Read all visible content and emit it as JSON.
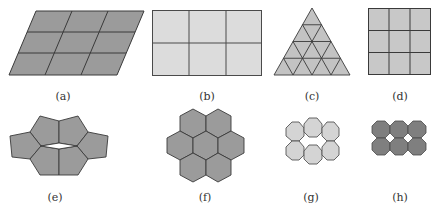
{
  "colors": {
    "stroke": "#3a3a3a",
    "dark_fill": "#9b9b9b",
    "mid_fill": "#c3c3c3",
    "light_fill": "#dcdcdc",
    "octagon_light": "#d4d4d4",
    "octagon_dark": "#7f7f7f"
  },
  "figures": [
    {
      "id": "a",
      "label": "(a)",
      "shape": "parallelogram grid 3x3",
      "label_x": 63,
      "label_y": 90
    },
    {
      "id": "b",
      "label": "(b)",
      "shape": "rectangle grid 3x2",
      "label_x": 207,
      "label_y": 90
    },
    {
      "id": "c",
      "label": "(c)",
      "shape": "triangle subdivided into 16 triangles",
      "label_x": 312,
      "label_y": 90
    },
    {
      "id": "d",
      "label": "(d)",
      "shape": "square grid 3x3",
      "label_x": 400,
      "label_y": 90
    },
    {
      "id": "e",
      "label": "(e)",
      "shape": "ring of 6 pentagons",
      "label_x": 55,
      "label_y": 191
    },
    {
      "id": "f",
      "label": "(f)",
      "shape": "cluster of 7 hexagons",
      "label_x": 205,
      "label_y": 191
    },
    {
      "id": "g",
      "label": "(g)",
      "shape": "ring of 6 heptagons/octagons",
      "label_x": 311,
      "label_y": 191
    },
    {
      "id": "h",
      "label": "(h)",
      "shape": "2x3 octagons",
      "label_x": 400,
      "label_y": 191
    }
  ]
}
